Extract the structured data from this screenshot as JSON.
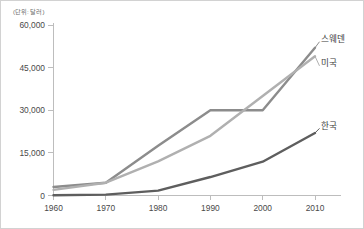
{
  "chart_data": {
    "type": "line",
    "title": "",
    "unit_note": "(단위: 달러)",
    "xlabel": "",
    "ylabel": "",
    "x": [
      1960,
      1970,
      1980,
      1990,
      2000,
      2010
    ],
    "categories": [
      "1960",
      "1970",
      "1980",
      "1990",
      "2000",
      "2010"
    ],
    "xlim": [
      1960,
      2010
    ],
    "ylim": [
      0,
      60000
    ],
    "y_ticks": [
      0,
      15000,
      30000,
      45000,
      60000
    ],
    "y_tick_labels": [
      "0",
      "15,000",
      "30,000",
      "45,000",
      "60,000"
    ],
    "x_ticks": [
      1960,
      1970,
      1980,
      1990,
      2000,
      2010
    ],
    "x_tick_labels": [
      "1960",
      "1970",
      "1980",
      "1990",
      "2000",
      "2010"
    ],
    "grid": false,
    "legend_position": "right-inline-labels",
    "series": [
      {
        "name": "스웨덴",
        "color": "#8c8c8c",
        "values": [
          3000,
          4500,
          17500,
          30000,
          30000,
          52000
        ],
        "label_x": 2010,
        "label_y": 55000
      },
      {
        "name": "미국",
        "color": "#b0b0b0",
        "values": [
          2000,
          4500,
          12000,
          21000,
          35000,
          49000
        ],
        "label_x": 2010,
        "label_y": 46500
      },
      {
        "name": "한국",
        "color": "#5e5e5e",
        "values": [
          100,
          300,
          1700,
          6500,
          11900,
          22000
        ],
        "label_x": 2010,
        "label_y": 24500
      }
    ]
  },
  "axis": {
    "line_color": "#bdbdbd",
    "tick_color": "#bdbdbd",
    "label_color": "#4a4a4a"
  },
  "frame": {
    "border_color": "#d2d2d2",
    "background": "#ffffff"
  }
}
